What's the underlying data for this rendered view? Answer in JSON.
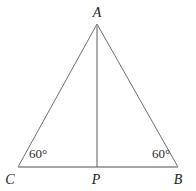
{
  "figure": {
    "type": "geometry-diagram",
    "labels": {
      "A": "A",
      "B": "B",
      "C": "C",
      "P": "P"
    },
    "angles": {
      "left": "60°",
      "right": "60°"
    },
    "colors": {
      "side_line": "#6f6f6f",
      "base_line": "#a6a6a6",
      "altitude_line": "#5c5c5c",
      "text": "#1c1c1c",
      "background": "#ffffff"
    }
  }
}
